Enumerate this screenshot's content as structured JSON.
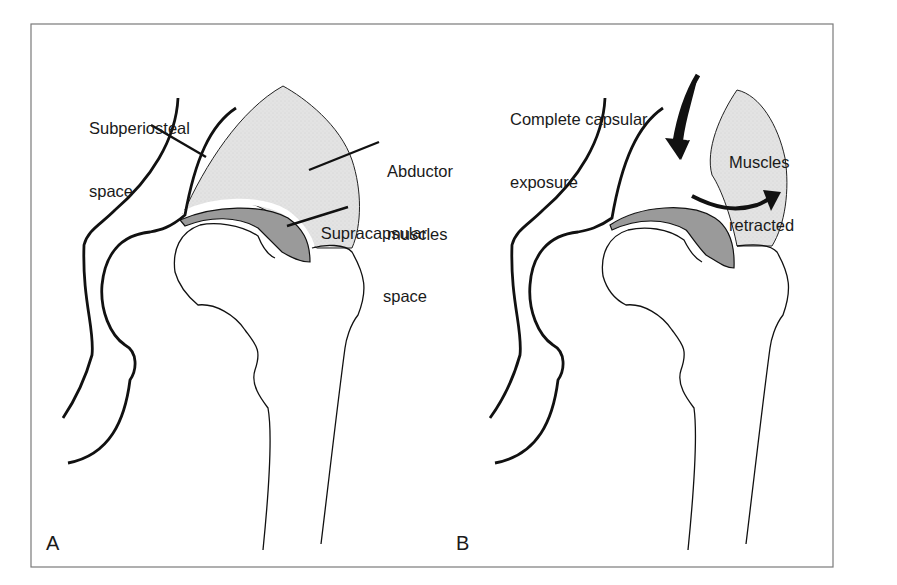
{
  "figure": {
    "colors": {
      "frame": "#7a7a7a",
      "outline": "#111111",
      "muscle_fill": "#e3e3e3",
      "capsule_fill": "#9a9a9a",
      "background": "#ffffff"
    },
    "panels": [
      {
        "letter": "A",
        "labels": {
          "subperiosteal_line1": "Subperiosteal",
          "subperiosteal_line2": "space",
          "abductor_line1": "Abductor",
          "abductor_line2": "muscles",
          "supracapsular_line1": "Supracapsular",
          "supracapsular_line2": "space"
        }
      },
      {
        "letter": "B",
        "labels": {
          "exposure_line1": "Complete capsular",
          "exposure_line2": "exposure",
          "retracted_line1": "Muscles",
          "retracted_line2": "retracted"
        }
      }
    ]
  }
}
